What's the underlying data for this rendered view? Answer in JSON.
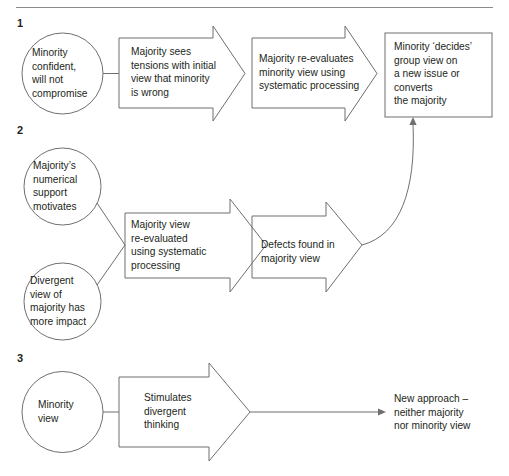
{
  "figure": {
    "title_rule": "horizontal-rule",
    "sections": [
      {
        "number": "1",
        "nodes": [
          {
            "shape": "circle",
            "name": "minority-confident-circle",
            "text": "Minority\nconfident,\nwill not\ncompromise"
          },
          {
            "shape": "block-arrow",
            "name": "majority-sees-tensions-arrow",
            "text": "Majority sees\ntensions with initial\nview that minority\nis wrong"
          },
          {
            "shape": "block-arrow",
            "name": "majority-reevaluates-arrow",
            "text": "Majority re-evaluates\nminority view using\nsystematic processing"
          },
          {
            "shape": "rect",
            "name": "minority-decides-box",
            "text": "Minority ‘decides’\ngroup view on\na new issue or\nconverts\nthe majority"
          }
        ]
      },
      {
        "number": "2",
        "nodes": [
          {
            "shape": "circle",
            "name": "majority-numerical-support-circle",
            "text": "Majority’s\nnumerical\nsupport\nmotivates"
          },
          {
            "shape": "circle",
            "name": "divergent-view-circle",
            "text": "Divergent\nview of\nmajority has\nmore impact"
          },
          {
            "shape": "block-arrow",
            "name": "majority-view-reevaluated-arrow",
            "text": "Majority view\nre-evaluated\nusing systematic\nprocessing"
          },
          {
            "shape": "block-arrow",
            "name": "defects-found-arrow",
            "text": "Defects found in\nmajority view"
          }
        ]
      },
      {
        "number": "3",
        "nodes": [
          {
            "shape": "circle",
            "name": "minority-view-circle",
            "text": "Minority\nview"
          },
          {
            "shape": "block-arrow",
            "name": "stimulates-divergent-thinking-arrow",
            "text": "Stimulates\ndivergent\nthinking"
          },
          {
            "shape": "rect",
            "name": "new-approach-box",
            "text": "New approach –\nneither majority\nnor minority view"
          }
        ]
      }
    ],
    "caption": "",
    "colors": {
      "stroke": "#6f6f6f",
      "text": "#231f20",
      "rule": "#8a8a8a",
      "background": "#ffffff"
    }
  }
}
